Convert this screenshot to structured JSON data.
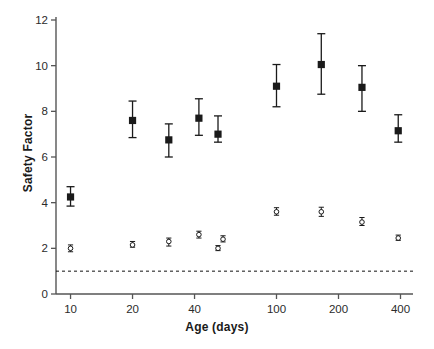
{
  "chart_data": {
    "type": "scatter",
    "title": "",
    "xlabel": "Age (days)",
    "ylabel": "Safety Factor",
    "xscale": "log",
    "xlim": [
      8.5,
      460
    ],
    "ylim": [
      0,
      12
    ],
    "xticks": [
      10,
      20,
      40,
      100,
      200,
      400
    ],
    "xtick_labels": [
      "10",
      "20",
      "40",
      "100",
      "200",
      "400"
    ],
    "yticks": [
      0,
      2,
      4,
      6,
      8,
      10,
      12
    ],
    "ytick_labels": [
      "0",
      "2",
      "4",
      "6",
      "8",
      "10",
      "12"
    ],
    "grid": false,
    "legend": null,
    "reference_line": {
      "y": 1,
      "style": "dashed",
      "color": "#111111"
    },
    "series": [
      {
        "name": "filled-square-series",
        "marker": "filled-square",
        "errorbars": true,
        "points": [
          {
            "x": 10,
            "y": 4.25,
            "yerr_low": 3.85,
            "yerr_high": 4.7
          },
          {
            "x": 20,
            "y": 7.6,
            "yerr_low": 6.85,
            "yerr_high": 8.45
          },
          {
            "x": 30,
            "y": 6.75,
            "yerr_low": 6.0,
            "yerr_high": 7.45
          },
          {
            "x": 42,
            "y": 7.7,
            "yerr_low": 6.95,
            "yerr_high": 8.55
          },
          {
            "x": 52,
            "y": 7.0,
            "yerr_low": 6.65,
            "yerr_high": 7.8
          },
          {
            "x": 100,
            "y": 9.1,
            "yerr_low": 8.2,
            "yerr_high": 10.05
          },
          {
            "x": 165,
            "y": 10.05,
            "yerr_low": 8.75,
            "yerr_high": 11.4
          },
          {
            "x": 260,
            "y": 9.05,
            "yerr_low": 8.0,
            "yerr_high": 10.0
          },
          {
            "x": 390,
            "y": 7.15,
            "yerr_low": 6.65,
            "yerr_high": 7.85
          }
        ]
      },
      {
        "name": "open-circle-series",
        "marker": "open-circle",
        "errorbars": true,
        "points": [
          {
            "x": 10,
            "y": 2.0,
            "yerr_low": 1.85,
            "yerr_high": 2.15
          },
          {
            "x": 20,
            "y": 2.15,
            "yerr_low": 2.05,
            "yerr_high": 2.3
          },
          {
            "x": 30,
            "y": 2.3,
            "yerr_low": 2.1,
            "yerr_high": 2.45
          },
          {
            "x": 42,
            "y": 2.6,
            "yerr_low": 2.45,
            "yerr_high": 2.75
          },
          {
            "x": 52,
            "y": 2.0,
            "yerr_low": 1.9,
            "yerr_high": 2.12
          },
          {
            "x": 55,
            "y": 2.4,
            "yerr_low": 2.28,
            "yerr_high": 2.55
          },
          {
            "x": 100,
            "y": 3.6,
            "yerr_low": 3.45,
            "yerr_high": 3.78
          },
          {
            "x": 165,
            "y": 3.6,
            "yerr_low": 3.4,
            "yerr_high": 3.8
          },
          {
            "x": 260,
            "y": 3.15,
            "yerr_low": 3.0,
            "yerr_high": 3.35
          },
          {
            "x": 390,
            "y": 2.45,
            "yerr_low": 2.35,
            "yerr_high": 2.58
          }
        ]
      }
    ]
  },
  "axes": {
    "ylabel_text": "Safety Factor",
    "xlabel_text": "Age (days)"
  }
}
